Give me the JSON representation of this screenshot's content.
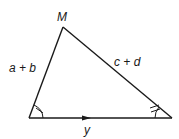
{
  "diagram": {
    "type": "triangle",
    "stroke_color": "#1a1a1a",
    "background": "#ffffff",
    "vertices": {
      "apex": {
        "label": "M",
        "x": 63,
        "y": 27
      },
      "bottom_left": {
        "label": "",
        "x": 29,
        "y": 118
      },
      "bottom_right": {
        "label": "",
        "x": 172,
        "y": 118
      }
    },
    "sides": {
      "left": {
        "label": "a + b"
      },
      "right": {
        "label": "c + d"
      },
      "base": {
        "label": "y",
        "arrow": "right"
      }
    },
    "angle_marks": {
      "bottom_left": {
        "arcs": 1,
        "ticks": 1
      },
      "bottom_right": {
        "arcs": 1,
        "ticks": 2
      }
    }
  }
}
